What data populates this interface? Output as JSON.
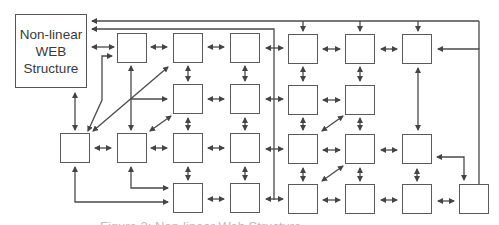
{
  "title_box": {
    "lines": [
      "Non-linear",
      "WEB",
      "Structure"
    ]
  },
  "colors": {
    "stroke": "#4a4a4a",
    "box_border": "#5a5a5a",
    "text": "#3a3a3a",
    "background": "#ffffff"
  },
  "grid": {
    "columns_x": [
      60,
      117,
      173,
      230,
      288,
      345,
      402,
      459
    ],
    "rows_y": [
      33,
      84,
      133,
      183
    ],
    "box_size": 30
  },
  "nodes": [
    {
      "id": "r1c2",
      "row": 1,
      "col": 2
    },
    {
      "id": "r1c3",
      "row": 1,
      "col": 3
    },
    {
      "id": "r1c4",
      "row": 1,
      "col": 4
    },
    {
      "id": "r1c5",
      "row": 1,
      "col": 5
    },
    {
      "id": "r1c6",
      "row": 1,
      "col": 6
    },
    {
      "id": "r1c7",
      "row": 1,
      "col": 7
    },
    {
      "id": "r2c3",
      "row": 2,
      "col": 3
    },
    {
      "id": "r2c4",
      "row": 2,
      "col": 4
    },
    {
      "id": "r2c5",
      "row": 2,
      "col": 5
    },
    {
      "id": "r2c6",
      "row": 2,
      "col": 6
    },
    {
      "id": "r3c1",
      "row": 3,
      "col": 1
    },
    {
      "id": "r3c2",
      "row": 3,
      "col": 2
    },
    {
      "id": "r3c3",
      "row": 3,
      "col": 3
    },
    {
      "id": "r3c4",
      "row": 3,
      "col": 4
    },
    {
      "id": "r3c5",
      "row": 3,
      "col": 5
    },
    {
      "id": "r3c6",
      "row": 3,
      "col": 6
    },
    {
      "id": "r3c7",
      "row": 3,
      "col": 7
    },
    {
      "id": "r4c3",
      "row": 4,
      "col": 3
    },
    {
      "id": "r4c4",
      "row": 4,
      "col": 4
    },
    {
      "id": "r4c5",
      "row": 4,
      "col": 5
    },
    {
      "id": "r4c6",
      "row": 4,
      "col": 6
    },
    {
      "id": "r4c7",
      "row": 4,
      "col": 7
    },
    {
      "id": "r4c8",
      "row": 4,
      "col": 8
    }
  ],
  "caption": {
    "text": "Figure 2: Non-linear Web Structure",
    "note": "caption mostly cropped at bottom edge"
  }
}
